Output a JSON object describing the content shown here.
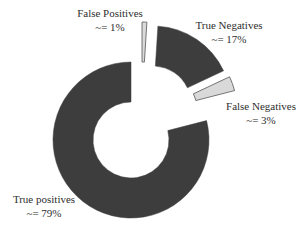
{
  "chart_data": {
    "type": "pie",
    "variant": "donut-exploded",
    "title": "",
    "categories": [
      "False Positives",
      "True Negatives",
      "False Negatives",
      "True positives"
    ],
    "values": [
      1,
      17,
      3,
      79
    ],
    "value_labels": [
      "~= 1%",
      "~= 17%",
      "~= 3%",
      "~= 79%"
    ],
    "unit": "%",
    "legend": "none (labels placed next to slices)",
    "colors": [
      "#d9d9d9",
      "#3d3d3d",
      "#d9d9d9",
      "#3d3d3d"
    ],
    "outline_color": "#555555",
    "start_angle_deg": 0,
    "direction": "clockwise",
    "center": [
      131,
      140
    ],
    "inner_radius": 38,
    "outer_radius": 78,
    "explode_offsets": [
      [
        11,
        -40
      ],
      [
        22,
        -36
      ],
      [
        28,
        -30
      ],
      [
        0,
        0
      ]
    ],
    "label_positions": [
      {
        "name": [
          110,
          17
        ],
        "value": [
          110,
          31
        ]
      },
      {
        "name": [
          229,
          29
        ],
        "value": [
          229,
          43
        ]
      },
      {
        "name": [
          261,
          110
        ],
        "value": [
          261,
          124
        ]
      },
      {
        "name": [
          44,
          203
        ],
        "value": [
          44,
          217
        ]
      }
    ]
  }
}
